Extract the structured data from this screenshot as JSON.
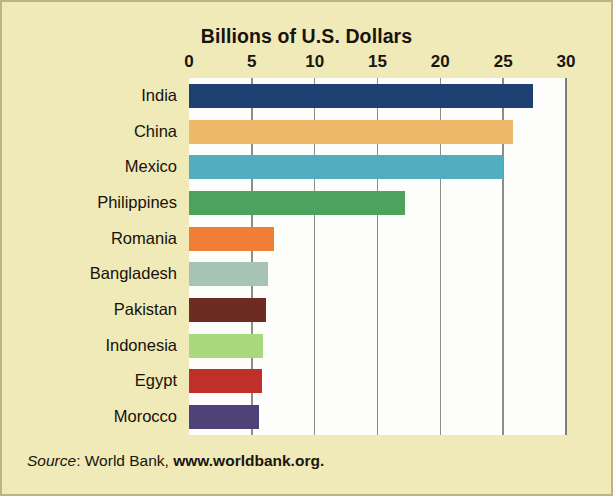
{
  "figure": {
    "title": "Billions of U.S. Dollars",
    "background_color": "#f3ecba",
    "plot_background_color": "#fdfdfb",
    "border_color": "#bdb385"
  },
  "source": {
    "label": "Source",
    "separator": ": ",
    "publisher": "World Bank,",
    "url": "www.worldbank.org."
  },
  "chart_data": {
    "type": "bar",
    "orientation": "horizontal",
    "title": "Billions of U.S. Dollars",
    "xlabel": "Billions of U.S. Dollars",
    "ylabel": "",
    "xlim": [
      0,
      30
    ],
    "ylim": null,
    "grid": true,
    "grid_axis": "x",
    "legend": false,
    "xticks": [
      0,
      5,
      10,
      15,
      20,
      25,
      30
    ],
    "xtick_labels": [
      "0",
      "5",
      "10",
      "15",
      "20",
      "25",
      "30"
    ],
    "categories": [
      "India",
      "China",
      "Mexico",
      "Philippines",
      "Romania",
      "Bangladesh",
      "Pakistan",
      "Indonesia",
      "Egypt",
      "Morocco"
    ],
    "values": [
      27.4,
      25.8,
      25.0,
      17.2,
      6.8,
      6.3,
      6.1,
      5.9,
      5.8,
      5.6
    ],
    "bar_colors": [
      "#1e3f72",
      "#f0b96a",
      "#51adc0",
      "#4da35e",
      "#ef7f35",
      "#a6c3b4",
      "#6d2b22",
      "#a9d97c",
      "#c0302a",
      "#4e4279"
    ]
  }
}
